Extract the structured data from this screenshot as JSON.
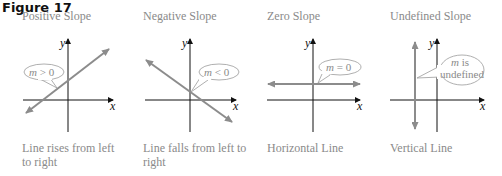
{
  "figure": {
    "title": "Figure 17"
  },
  "colors": {
    "axis": "#111111",
    "line": "#8c8c8c",
    "text_gray": "#8a8a8a",
    "callout_stroke": "#9a9a9a"
  },
  "panels": [
    {
      "title": "Positive Slope",
      "callout_var": "m",
      "callout_rest": " > 0",
      "caption": "Line rises from left to right",
      "x_label": "x",
      "y_label": "y"
    },
    {
      "title": "Negative Slope",
      "callout_var": "m",
      "callout_rest": " < 0",
      "caption": "Line falls from left to right",
      "x_label": "x",
      "y_label": "y"
    },
    {
      "title": "Zero Slope",
      "callout_var": "m",
      "callout_rest": " = 0",
      "caption": "Horizontal Line",
      "x_label": "x",
      "y_label": "y"
    },
    {
      "title": "Undefined Slope",
      "callout_var": "m",
      "callout_rest": " is",
      "callout_line2": "undefined",
      "caption": "Vertical Line",
      "x_label": "x",
      "y_label": "y"
    }
  ]
}
